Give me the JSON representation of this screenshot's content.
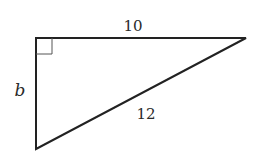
{
  "diagram": {
    "type": "right-triangle",
    "stroke_color": "#222222",
    "vertices": {
      "right_angle": [
        36,
        38
      ],
      "top_right": [
        246,
        38
      ],
      "bottom": [
        36,
        149
      ]
    },
    "right_angle_marker": {
      "vertex": "right_angle",
      "size": 16
    },
    "labels": {
      "top_side": "10",
      "hypotenuse": "12",
      "left_side": "b"
    }
  }
}
